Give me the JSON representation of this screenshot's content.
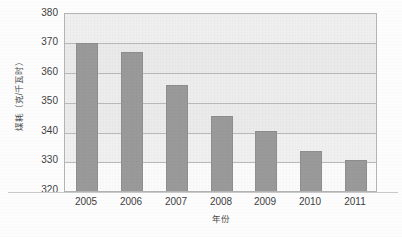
{
  "chart_data": {
    "type": "bar",
    "title": "",
    "xlabel": "年份",
    "ylabel": "煤耗（克/千瓦时）",
    "categories": [
      "2005",
      "2006",
      "2007",
      "2008",
      "2009",
      "2010",
      "2011"
    ],
    "values": [
      370.2,
      367.1,
      356.1,
      345.3,
      340.2,
      333.5,
      330.4
    ],
    "series": [
      {
        "name": "煤耗（克/千瓦时）",
        "values": [
          370.2,
          367.1,
          356.1,
          345.3,
          340.2,
          333.5,
          330.4
        ]
      }
    ],
    "ylim": [
      320,
      380
    ],
    "ytick_labels": [
      "320",
      "330",
      "340",
      "350",
      "360",
      "370",
      "380"
    ],
    "ytick_values": [
      320,
      330,
      340,
      350,
      360,
      370,
      380
    ],
    "ytick_step": 10,
    "xtick_labels": [
      "2005",
      "2006",
      "2007",
      "2008",
      "2009",
      "2010",
      "2011"
    ],
    "grid": true,
    "grid_axis": "y",
    "legend": false,
    "legend_position": "none",
    "bar_color": "#9a9a9a",
    "plot_background": "#f3f3f3",
    "frame_color": "#b4b4b4",
    "gridline_color": "#b9b9b9",
    "text_color": "#3d3d3d"
  }
}
